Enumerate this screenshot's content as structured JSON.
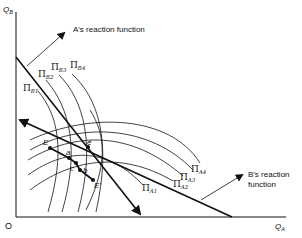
{
  "axes": {
    "y_label": "Q",
    "y_sub": "B",
    "x_label": "Q",
    "x_sub": "A",
    "origin": "O"
  },
  "annotations": {
    "a_reaction": "A's reaction function",
    "b_reaction_line1": "B's reaction",
    "b_reaction_line2": "function"
  },
  "isoprofit_B": [
    {
      "pi": "Π",
      "sub": "B1"
    },
    {
      "pi": "Π",
      "sub": "B2"
    },
    {
      "pi": "Π",
      "sub": "B3"
    },
    {
      "pi": "Π",
      "sub": "B4"
    }
  ],
  "isoprofit_A": [
    {
      "pi": "Π",
      "sub": "A1"
    },
    {
      "pi": "Π",
      "sub": "A2"
    },
    {
      "pi": "Π",
      "sub": "A3"
    },
    {
      "pi": "Π",
      "sub": "A4"
    }
  ],
  "points": {
    "E": "E",
    "a": "a",
    "c": "c",
    "b": "b",
    "e": "e",
    "E_prime": "E'"
  }
}
